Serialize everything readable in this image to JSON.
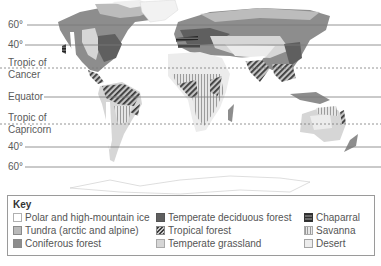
{
  "map": {
    "latitude_lines": [
      {
        "label": "60°",
        "y": 25,
        "style": "solid"
      },
      {
        "label": "40°",
        "y": 45,
        "style": "solid"
      },
      {
        "label": "Tropic of Cancer",
        "line1": "Tropic of",
        "line2": "Cancer",
        "y": 68,
        "style": "dashed"
      },
      {
        "label": "Equator",
        "y": 97,
        "style": "solid"
      },
      {
        "label": "Tropic of Capricorn",
        "line1": "Tropic of",
        "line2": "Capricorn",
        "y": 124,
        "style": "dashed"
      },
      {
        "label": "40°",
        "y": 147,
        "style": "solid"
      },
      {
        "label": "60°",
        "y": 167,
        "style": "solid"
      }
    ],
    "colors": {
      "polar": "#ffffff",
      "tundra": "#b9b9b9",
      "coniferous": "#8d8d8d",
      "deciduous": "#5f5f5f",
      "grassland": "#d6d6d6",
      "desert": "#ececec",
      "lines": "#7a7a7a"
    }
  },
  "key": {
    "title": "Key",
    "items": [
      {
        "label": "Polar and high-mountain ice",
        "swatch": "polar"
      },
      {
        "label": "Tundra (arctic and alpine)",
        "swatch": "tundra"
      },
      {
        "label": "Coniferous forest",
        "swatch": "coniferous"
      },
      {
        "label": "Temperate deciduous forest",
        "swatch": "deciduous"
      },
      {
        "label": "Tropical forest",
        "swatch": "tropical-hatched"
      },
      {
        "label": "Temperate grassland",
        "swatch": "grassland"
      },
      {
        "label": "Chaparral",
        "swatch": "chaparral-horizontal-stripes"
      },
      {
        "label": "Savanna",
        "swatch": "savanna-vertical-stripes"
      },
      {
        "label": "Desert",
        "swatch": "desert"
      }
    ]
  }
}
